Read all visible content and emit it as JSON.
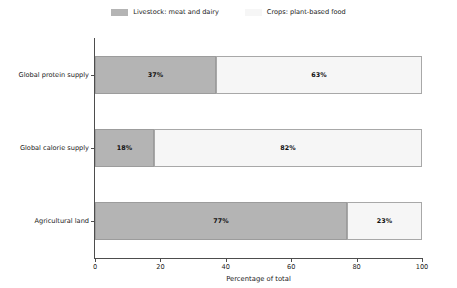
{
  "chart_data": {
    "type": "bar",
    "orientation": "horizontal",
    "stacked": true,
    "normalized_percent": true,
    "title": "",
    "subtitle": "",
    "xlabel": "Percentage of total",
    "ylabel": "",
    "xlim": [
      0,
      100
    ],
    "xticks": [
      "0",
      "20",
      "40",
      "60",
      "80",
      "100"
    ],
    "xtick_values": [
      0,
      20,
      40,
      60,
      80,
      100
    ],
    "grid": false,
    "legend_position": "top-center",
    "categories": [
      "Global protein supply",
      "Global calorie supply",
      "Agricultural land"
    ],
    "series": [
      {
        "name": "Livestock: meat and dairy",
        "color": "#b4b4b4",
        "values": [
          37,
          18,
          77
        ],
        "labels": [
          "37%",
          "18%",
          "77%"
        ]
      },
      {
        "name": "Crops: plant-based food",
        "color": "#f6f6f6",
        "values": [
          63,
          82,
          23
        ],
        "labels": [
          "63%",
          "82%",
          "23%"
        ]
      }
    ]
  },
  "legend": {
    "items": [
      {
        "label": "Livestock: meat and dairy",
        "color": "#b4b4b4"
      },
      {
        "label": "Crops: plant-based food",
        "color": "#f6f6f6"
      }
    ]
  },
  "axes": {
    "x_title": "Percentage of total"
  }
}
